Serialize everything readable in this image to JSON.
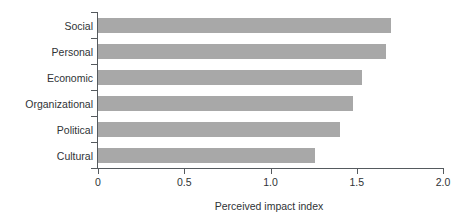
{
  "chart_data": {
    "type": "bar",
    "orientation": "horizontal",
    "title": "",
    "subtitle": "",
    "xlabel": "Perceived impact index",
    "ylabel": "",
    "categories": [
      "Social",
      "Personal",
      "Economic",
      "Organizational",
      "Political",
      "Cultural"
    ],
    "values": [
      1.7,
      1.67,
      1.53,
      1.48,
      1.4,
      1.26
    ],
    "series": [
      {
        "name": "Perceived impact index",
        "values": [
          1.7,
          1.67,
          1.53,
          1.48,
          1.4,
          1.26
        ]
      }
    ],
    "xlim": [
      0,
      2.0
    ],
    "xticks": [
      0,
      0.5,
      1.0,
      1.5,
      2.0
    ],
    "xtick_labels": [
      "0",
      "0.5",
      "1.0",
      "1.5",
      "2.0"
    ],
    "grid": false,
    "legend": false,
    "legend_position": "none",
    "bar_color": "#a8a8a8",
    "axis_color": "#555a5e",
    "text_color": "#2f3336",
    "background_color": "#ffffff"
  },
  "axis": {
    "x_title": "Perceived impact index",
    "ticks": [
      {
        "label": "0",
        "value": 0
      },
      {
        "label": "0.5",
        "value": 0.5
      },
      {
        "label": "1.0",
        "value": 1.0
      },
      {
        "label": "1.5",
        "value": 1.5
      },
      {
        "label": "2.0",
        "value": 2.0
      }
    ]
  },
  "bars": [
    {
      "label": "Social",
      "value": 1.7
    },
    {
      "label": "Personal",
      "value": 1.67
    },
    {
      "label": "Economic",
      "value": 1.53
    },
    {
      "label": "Organizational",
      "value": 1.48
    },
    {
      "label": "Political",
      "value": 1.4
    },
    {
      "label": "Cultural",
      "value": 1.26
    }
  ]
}
